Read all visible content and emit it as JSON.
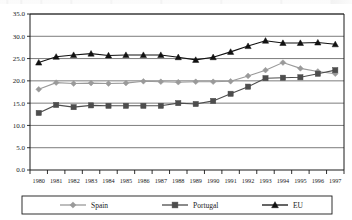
{
  "chart_data": {
    "type": "line",
    "title": "",
    "subtitle": "",
    "xlabel": "",
    "ylabel": "",
    "categories": [
      "1980",
      "1981",
      "1982",
      "1983",
      "1984",
      "1985",
      "1986",
      "1987",
      "1988",
      "1989",
      "1990",
      "1991",
      "1992",
      "1993",
      "1994",
      "1995",
      "1996",
      "1997"
    ],
    "x_tick_labels": [
      "1980",
      "1981",
      "1982",
      "1983",
      "1984",
      "1985",
      "1986",
      "1987",
      "1988",
      "1989",
      "1990",
      "1991",
      "1992",
      "1993",
      "1994",
      "1995",
      "1996",
      "1997"
    ],
    "y_tick_labels": [
      "0.0",
      "5.0",
      "10.0",
      "15.0",
      "20.0",
      "25.0",
      "30.0",
      "35.0"
    ],
    "y_ticks": [
      0.0,
      5.0,
      10.0,
      15.0,
      20.0,
      25.0,
      30.0,
      35.0
    ],
    "ylim": [
      0.0,
      35.0
    ],
    "grid": true,
    "grid_axis": "y",
    "legend_position": "bottom",
    "series": [
      {
        "name": "Spain",
        "color": "#9a9a9a",
        "marker": "diamond",
        "values": [
          18.1,
          19.6,
          19.4,
          19.5,
          19.4,
          19.5,
          19.9,
          19.8,
          19.7,
          19.8,
          19.8,
          19.9,
          21.1,
          22.4,
          24.1,
          22.8,
          22.1,
          21.6
        ]
      },
      {
        "name": "Portugal",
        "color": "#4d4d4d",
        "marker": "square",
        "values": [
          12.8,
          14.6,
          14.1,
          14.5,
          14.4,
          14.4,
          14.4,
          14.4,
          15.0,
          14.8,
          15.5,
          17.1,
          18.7,
          20.6,
          20.7,
          20.8,
          21.6,
          22.4
        ]
      },
      {
        "name": "EU",
        "color": "#111111",
        "marker": "triangle",
        "values": [
          24.1,
          25.4,
          25.8,
          26.1,
          25.7,
          25.8,
          25.8,
          25.8,
          25.3,
          24.7,
          25.3,
          26.5,
          27.8,
          29.0,
          28.5,
          28.5,
          28.6,
          28.2
        ]
      }
    ],
    "legend": [
      {
        "label": "Spain",
        "color": "#9a9a9a",
        "marker": "diamond"
      },
      {
        "label": "Portugal",
        "color": "#4d4d4d",
        "marker": "square"
      },
      {
        "label": "EU",
        "color": "#111111",
        "marker": "triangle"
      }
    ]
  }
}
